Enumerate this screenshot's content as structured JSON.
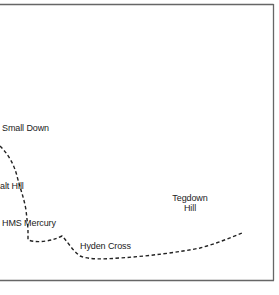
{
  "map": {
    "frame_color": "#666666",
    "route_color": "#222222",
    "labels": {
      "small_down": "Small Down",
      "chalt_hill": "alt Hill",
      "hms_mercury": "HMS Mercury",
      "hyden_cross": "Hyden Cross",
      "tegdown_hill_line1": "Tegdown",
      "tegdown_hill_line2": "Hill"
    }
  }
}
